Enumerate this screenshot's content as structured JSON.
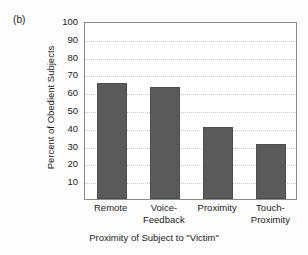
{
  "figure": {
    "panel_label": "(b)",
    "background_color": "#fdfdfd",
    "bar_color": "#5a5a5a",
    "grid_color": "#c8c8c8",
    "frame_color": "#8a8a8a"
  },
  "chart_data": {
    "type": "bar",
    "title": "",
    "categories": [
      "Remote",
      "Voice-Feedback",
      "Proximity",
      "Touch-Proximity"
    ],
    "category_lines": [
      [
        "Remote",
        ""
      ],
      [
        "Voice-",
        "Feedback"
      ],
      [
        "Proximity",
        ""
      ],
      [
        "Touch-",
        "Proximity"
      ]
    ],
    "values": [
      65,
      63,
      40.5,
      31
    ],
    "xlabel": "Proximity of Subject to \"Victim\"",
    "ylabel": "Percent of Obedient Subjects",
    "ylim": [
      0,
      100
    ],
    "ytick_values": [
      100,
      90,
      80,
      70,
      60,
      50,
      40,
      30,
      20,
      10
    ],
    "ytick_labels": [
      "100",
      "90",
      "80",
      "70",
      "60",
      "50",
      "40",
      "30",
      "20",
      "10"
    ],
    "grid": "horizontal-dotted",
    "legend": "none"
  }
}
